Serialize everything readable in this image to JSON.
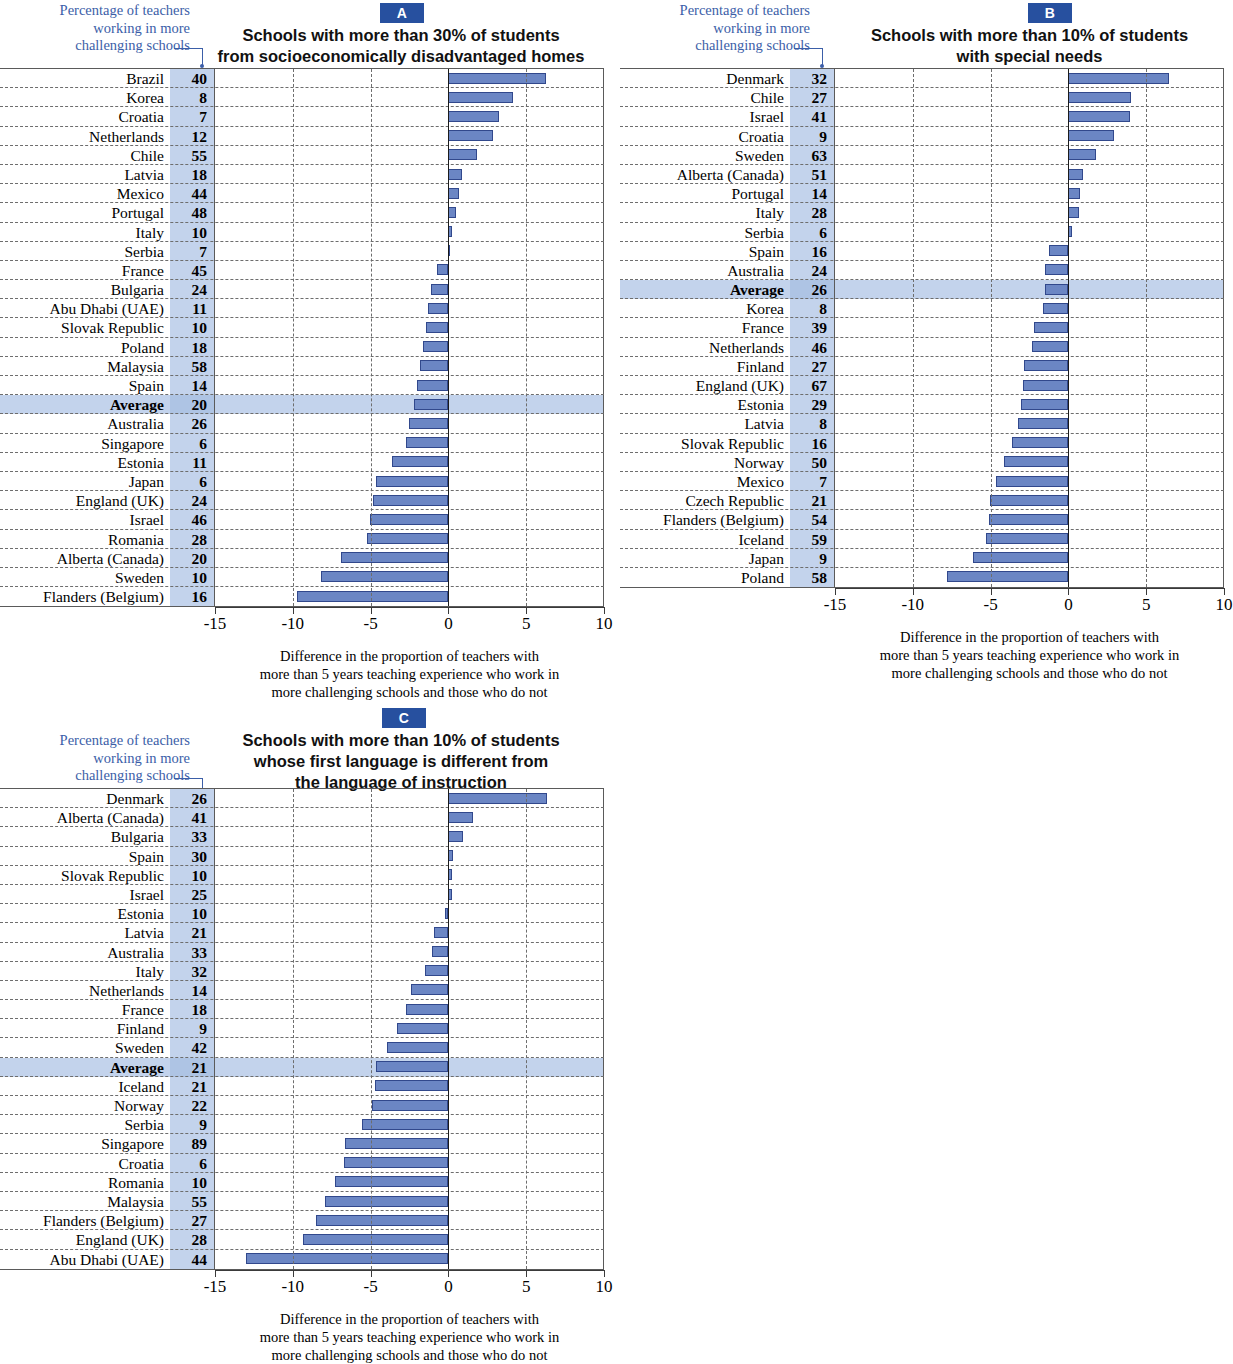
{
  "legend_note": "Percentage of teachers\nworking in more\nchallenging schools",
  "axis": {
    "ticks": [
      "-15",
      "-10",
      "-5",
      "0",
      "5",
      "10"
    ],
    "min": -15,
    "max": 10,
    "caption": "Difference in the proportion of teachers with\nmore than 5 years teaching experience who work in\nmore challenging schools and those who do not",
    "caption_line1": "Difference in the proportion of teachers with",
    "caption_line2": "more than 5 years teaching experience who work in",
    "caption_line3": "more challenging schools and those who do not"
  },
  "colors": {
    "badge": "#27509f",
    "bar_fill": "#6b86c4",
    "bar_border": "#31488c",
    "shade_column": "#c3d3ec",
    "note_text": "#3b5ea8",
    "average_row": "#c3d3ec"
  },
  "panels": [
    {
      "id": "A",
      "badge": "A",
      "title": "Schools with more than 30% of students\nfrom socioeconomically disadvantaged homes",
      "title_line1": "Schools with more than 30% of students",
      "title_line2": "from socioeconomically disadvantaged homes",
      "rows": [
        {
          "label": "Brazil",
          "pct": 40,
          "diff": 6.3
        },
        {
          "label": "Korea",
          "pct": 8,
          "diff": 4.2
        },
        {
          "label": "Croatia",
          "pct": 7,
          "diff": 3.3
        },
        {
          "label": "Netherlands",
          "pct": 12,
          "diff": 2.9
        },
        {
          "label": "Chile",
          "pct": 55,
          "diff": 1.9
        },
        {
          "label": "Latvia",
          "pct": 18,
          "diff": 0.9
        },
        {
          "label": "Mexico",
          "pct": 44,
          "diff": 0.75
        },
        {
          "label": "Portugal",
          "pct": 48,
          "diff": 0.55
        },
        {
          "label": "Italy",
          "pct": 10,
          "diff": 0.25
        },
        {
          "label": "Serbia",
          "pct": 7,
          "diff": 0.15
        },
        {
          "label": "France",
          "pct": 45,
          "diff": -0.7
        },
        {
          "label": "Bulgaria",
          "pct": 24,
          "diff": -1.1
        },
        {
          "label": "Abu Dhabi (UAE)",
          "pct": 11,
          "diff": -1.3
        },
        {
          "label": "Slovak Republic",
          "pct": 10,
          "diff": -1.4
        },
        {
          "label": "Poland",
          "pct": 18,
          "diff": -1.6
        },
        {
          "label": "Malaysia",
          "pct": 58,
          "diff": -1.8
        },
        {
          "label": "Spain",
          "pct": 14,
          "diff": -2.0
        },
        {
          "label": "Average",
          "pct": 20,
          "diff": -2.2,
          "is_average": true
        },
        {
          "label": "Australia",
          "pct": 26,
          "diff": -2.5
        },
        {
          "label": "Singapore",
          "pct": 6,
          "diff": -2.7
        },
        {
          "label": "Estonia",
          "pct": 11,
          "diff": -3.6
        },
        {
          "label": "Japan",
          "pct": 6,
          "diff": -4.6
        },
        {
          "label": "England (UK)",
          "pct": 24,
          "diff": -4.8
        },
        {
          "label": "Israel",
          "pct": 46,
          "diff": -5.0
        },
        {
          "label": "Romania",
          "pct": 28,
          "diff": -5.2
        },
        {
          "label": "Alberta (Canada)",
          "pct": 20,
          "diff": -6.9
        },
        {
          "label": "Sweden",
          "pct": 10,
          "diff": -8.2
        },
        {
          "label": "Flanders (Belgium)",
          "pct": 16,
          "diff": -9.7
        }
      ]
    },
    {
      "id": "B",
      "badge": "B",
      "title": "Schools with more than 10% of students\nwith special needs",
      "title_line1": "Schools with more than 10% of students",
      "title_line2": "with special needs",
      "rows": [
        {
          "label": "Denmark",
          "pct": 32,
          "diff": 6.5
        },
        {
          "label": "Chile",
          "pct": 27,
          "diff": 4.1
        },
        {
          "label": "Israel",
          "pct": 41,
          "diff": 4.0
        },
        {
          "label": "Croatia",
          "pct": 9,
          "diff": 3.0
        },
        {
          "label": "Sweden",
          "pct": 63,
          "diff": 1.8
        },
        {
          "label": "Alberta (Canada)",
          "pct": 51,
          "diff": 1.0
        },
        {
          "label": "Portugal",
          "pct": 14,
          "diff": 0.8
        },
        {
          "label": "Italy",
          "pct": 28,
          "diff": 0.75
        },
        {
          "label": "Serbia",
          "pct": 6,
          "diff": 0.25
        },
        {
          "label": "Spain",
          "pct": 16,
          "diff": -1.2
        },
        {
          "label": "Australia",
          "pct": 24,
          "diff": -1.5
        },
        {
          "label": "Average",
          "pct": 26,
          "diff": -1.5,
          "is_average": true
        },
        {
          "label": "Korea",
          "pct": 8,
          "diff": -1.6
        },
        {
          "label": "France",
          "pct": 39,
          "diff": -2.2
        },
        {
          "label": "Netherlands",
          "pct": 46,
          "diff": -2.3
        },
        {
          "label": "Finland",
          "pct": 27,
          "diff": -2.8
        },
        {
          "label": "England (UK)",
          "pct": 67,
          "diff": -2.9
        },
        {
          "label": "Estonia",
          "pct": 29,
          "diff": -3.0
        },
        {
          "label": "Latvia",
          "pct": 8,
          "diff": -3.2
        },
        {
          "label": "Slovak Republic",
          "pct": 16,
          "diff": -3.6
        },
        {
          "label": "Norway",
          "pct": 50,
          "diff": -4.1
        },
        {
          "label": "Mexico",
          "pct": 7,
          "diff": -4.6
        },
        {
          "label": "Czech Republic",
          "pct": 21,
          "diff": -5.0
        },
        {
          "label": "Flanders (Belgium)",
          "pct": 54,
          "diff": -5.1
        },
        {
          "label": "Iceland",
          "pct": 59,
          "diff": -5.3
        },
        {
          "label": "Japan",
          "pct": 9,
          "diff": -6.1
        },
        {
          "label": "Poland",
          "pct": 58,
          "diff": -7.8
        }
      ]
    },
    {
      "id": "C",
      "badge": "C",
      "title": "Schools with more than 10% of students\nwhose first language is different from\nthe language of instruction",
      "title_line1": "Schools with more than 10% of students",
      "title_line2": "whose first language is different from",
      "title_line3": "the language of instruction",
      "rows": [
        {
          "label": "Denmark",
          "pct": 26,
          "diff": 6.4
        },
        {
          "label": "Alberta (Canada)",
          "pct": 41,
          "diff": 1.6
        },
        {
          "label": "Bulgaria",
          "pct": 33,
          "diff": 1.0
        },
        {
          "label": "Spain",
          "pct": 30,
          "diff": 0.35
        },
        {
          "label": "Slovak Republic",
          "pct": 10,
          "diff": 0.3
        },
        {
          "label": "Israel",
          "pct": 25,
          "diff": 0.25
        },
        {
          "label": "Estonia",
          "pct": 10,
          "diff": -0.2
        },
        {
          "label": "Latvia",
          "pct": 21,
          "diff": -0.9
        },
        {
          "label": "Australia",
          "pct": 33,
          "diff": -1.0
        },
        {
          "label": "Italy",
          "pct": 32,
          "diff": -1.5
        },
        {
          "label": "Netherlands",
          "pct": 14,
          "diff": -2.4
        },
        {
          "label": "France",
          "pct": 18,
          "diff": -2.7
        },
        {
          "label": "Finland",
          "pct": 9,
          "diff": -3.3
        },
        {
          "label": "Sweden",
          "pct": 42,
          "diff": -3.9
        },
        {
          "label": "Average",
          "pct": 21,
          "diff": -4.6,
          "is_average": true
        },
        {
          "label": "Iceland",
          "pct": 21,
          "diff": -4.7
        },
        {
          "label": "Norway",
          "pct": 22,
          "diff": -4.9
        },
        {
          "label": "Serbia",
          "pct": 9,
          "diff": -5.5
        },
        {
          "label": "Singapore",
          "pct": 89,
          "diff": -6.6
        },
        {
          "label": "Croatia",
          "pct": 6,
          "diff": -6.7
        },
        {
          "label": "Romania",
          "pct": 10,
          "diff": -7.3
        },
        {
          "label": "Malaysia",
          "pct": 55,
          "diff": -7.9
        },
        {
          "label": "Flanders (Belgium)",
          "pct": 27,
          "diff": -8.5
        },
        {
          "label": "England (UK)",
          "pct": 28,
          "diff": -9.3
        },
        {
          "label": "Abu Dhabi (UAE)",
          "pct": 44,
          "diff": -13.0
        }
      ]
    }
  ],
  "chart_data": {
    "type": "bar",
    "orientation": "horizontal",
    "xlabel": "Difference in the proportion of teachers with more than 5 years teaching experience who work in more challenging schools and those who do not",
    "ylabel": "",
    "xlim": [
      -15,
      10
    ],
    "xticks": [
      -15,
      -10,
      -5,
      0,
      5,
      10
    ],
    "grid": true,
    "legend": "none",
    "panels": [
      {
        "panel": "A",
        "title": "Schools with more than 30% of students from socioeconomically disadvantaged homes",
        "categories": [
          "Brazil",
          "Korea",
          "Croatia",
          "Netherlands",
          "Chile",
          "Latvia",
          "Mexico",
          "Portugal",
          "Italy",
          "Serbia",
          "France",
          "Bulgaria",
          "Abu Dhabi (UAE)",
          "Slovak Republic",
          "Poland",
          "Malaysia",
          "Spain",
          "Average",
          "Australia",
          "Singapore",
          "Estonia",
          "Japan",
          "England (UK)",
          "Israel",
          "Romania",
          "Alberta (Canada)",
          "Sweden",
          "Flanders (Belgium)"
        ],
        "values": [
          6.3,
          4.2,
          3.3,
          2.9,
          1.9,
          0.9,
          0.75,
          0.55,
          0.25,
          0.15,
          -0.7,
          -1.1,
          -1.3,
          -1.4,
          -1.6,
          -1.8,
          -2.0,
          -2.2,
          -2.5,
          -2.7,
          -3.6,
          -4.6,
          -4.8,
          -5.0,
          -5.2,
          -6.9,
          -8.2,
          -9.7
        ],
        "percentage_in_challenging_schools": [
          40,
          8,
          7,
          12,
          55,
          18,
          44,
          48,
          10,
          7,
          45,
          24,
          11,
          10,
          18,
          58,
          14,
          20,
          26,
          6,
          11,
          6,
          24,
          46,
          28,
          20,
          10,
          16
        ]
      },
      {
        "panel": "B",
        "title": "Schools with more than 10% of students with special needs",
        "categories": [
          "Denmark",
          "Chile",
          "Israel",
          "Croatia",
          "Sweden",
          "Alberta (Canada)",
          "Portugal",
          "Italy",
          "Serbia",
          "Spain",
          "Australia",
          "Average",
          "Korea",
          "France",
          "Netherlands",
          "Finland",
          "England (UK)",
          "Estonia",
          "Latvia",
          "Slovak Republic",
          "Norway",
          "Mexico",
          "Czech Republic",
          "Flanders (Belgium)",
          "Iceland",
          "Japan",
          "Poland"
        ],
        "values": [
          6.5,
          4.1,
          4.0,
          3.0,
          1.8,
          1.0,
          0.8,
          0.75,
          0.25,
          -1.2,
          -1.5,
          -1.5,
          -1.6,
          -2.2,
          -2.3,
          -2.8,
          -2.9,
          -3.0,
          -3.2,
          -3.6,
          -4.1,
          -4.6,
          -5.0,
          -5.1,
          -5.3,
          -6.1,
          -7.8
        ],
        "percentage_in_challenging_schools": [
          32,
          27,
          41,
          9,
          63,
          51,
          14,
          28,
          6,
          16,
          24,
          26,
          8,
          39,
          46,
          27,
          67,
          29,
          8,
          16,
          50,
          7,
          21,
          54,
          59,
          9,
          58
        ]
      },
      {
        "panel": "C",
        "title": "Schools with more than 10% of students whose first language is different from the language of instruction",
        "categories": [
          "Denmark",
          "Alberta (Canada)",
          "Bulgaria",
          "Spain",
          "Slovak Republic",
          "Israel",
          "Estonia",
          "Latvia",
          "Australia",
          "Italy",
          "Netherlands",
          "France",
          "Finland",
          "Sweden",
          "Average",
          "Iceland",
          "Norway",
          "Serbia",
          "Singapore",
          "Croatia",
          "Romania",
          "Malaysia",
          "Flanders (Belgium)",
          "England (UK)",
          "Abu Dhabi (UAE)"
        ],
        "values": [
          6.4,
          1.6,
          1.0,
          0.35,
          0.3,
          0.25,
          -0.2,
          -0.9,
          -1.0,
          -1.5,
          -2.4,
          -2.7,
          -3.3,
          -3.9,
          -4.6,
          -4.7,
          -4.9,
          -5.5,
          -6.6,
          -6.7,
          -7.3,
          -7.9,
          -8.5,
          -9.3,
          -13.0
        ],
        "percentage_in_challenging_schools": [
          26,
          41,
          33,
          30,
          10,
          25,
          10,
          21,
          33,
          32,
          14,
          18,
          9,
          42,
          21,
          21,
          22,
          9,
          89,
          6,
          10,
          55,
          27,
          28,
          44
        ]
      }
    ]
  }
}
